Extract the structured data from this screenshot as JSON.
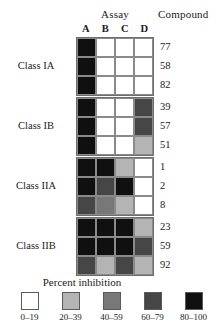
{
  "header": {
    "assay_title": "Assay",
    "compound_title": "Compound",
    "columns": [
      "A",
      "B",
      "C",
      "D"
    ]
  },
  "legend": {
    "title": "Percent inhibition",
    "bins": [
      {
        "label": "0–19",
        "color": "#ffffff"
      },
      {
        "label": "20–39",
        "color": "#b4b4b4"
      },
      {
        "label": "40–59",
        "color": "#787878"
      },
      {
        "label": "60–79",
        "color": "#464646"
      },
      {
        "label": "80–100",
        "color": "#101010"
      }
    ]
  },
  "chart_data": {
    "type": "heatmap",
    "title": "Percent inhibition",
    "xlabel": "Assay",
    "ylabel": "Compound",
    "x": [
      "A",
      "B",
      "C",
      "D"
    ],
    "legend_position": "bottom",
    "grid": true,
    "value_bins": [
      "0–19",
      "20–39",
      "40–59",
      "60–79",
      "80–100"
    ],
    "bin_colors": [
      "#ffffff",
      "#b4b4b4",
      "#787878",
      "#464646",
      "#101010"
    ],
    "groups": [
      {
        "name": "Class IA",
        "rows": [
          {
            "compound": "77",
            "bins": [
              4,
              0,
              0,
              0
            ]
          },
          {
            "compound": "58",
            "bins": [
              4,
              0,
              0,
              0
            ]
          },
          {
            "compound": "82",
            "bins": [
              4,
              0,
              0,
              0
            ]
          }
        ]
      },
      {
        "name": "Class IB",
        "rows": [
          {
            "compound": "39",
            "bins": [
              4,
              0,
              0,
              3
            ]
          },
          {
            "compound": "57",
            "bins": [
              4,
              0,
              0,
              3
            ]
          },
          {
            "compound": "51",
            "bins": [
              4,
              0,
              0,
              1
            ]
          }
        ]
      },
      {
        "name": "Class IIA",
        "rows": [
          {
            "compound": "1",
            "bins": [
              4,
              4,
              1,
              0
            ]
          },
          {
            "compound": "2",
            "bins": [
              4,
              3,
              4,
              0
            ]
          },
          {
            "compound": "8",
            "bins": [
              3,
              2,
              1,
              0
            ]
          }
        ]
      },
      {
        "name": "Class IIB",
        "rows": [
          {
            "compound": "23",
            "bins": [
              4,
              4,
              4,
              1
            ]
          },
          {
            "compound": "59",
            "bins": [
              4,
              4,
              4,
              3
            ]
          },
          {
            "compound": "92",
            "bins": [
              3,
              1,
              3,
              1
            ]
          }
        ]
      }
    ]
  }
}
